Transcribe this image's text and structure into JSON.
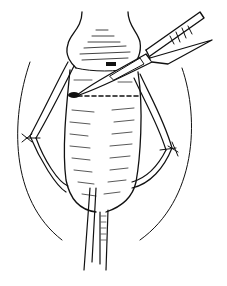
{
  "figure": {
    "type": "surgical line illustration",
    "style": "black ink line drawing on white",
    "colors": {
      "ink": "#111111",
      "background": "#ffffff"
    },
    "elements": [
      "scalpel",
      "incision dashed line",
      "penile shaft",
      "glans",
      "sutured skin flaps (left and right)",
      "catheter",
      "surrounding drape outline"
    ]
  }
}
